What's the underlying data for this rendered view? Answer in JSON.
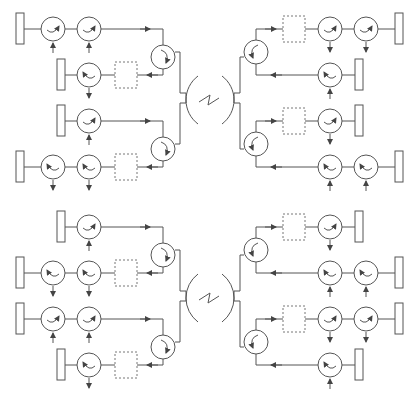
{
  "diagram": {
    "title": "",
    "colors": {
      "line": "#555555",
      "background": "#ffffff",
      "text": "#333333"
    },
    "channel": {
      "symbol": "~",
      "icon": "channel-lightning-icon"
    },
    "modulator_labels": [
      "+",
      "−",
      "+"
    ],
    "halves": [
      {
        "id": "upper",
        "left": {
          "rows": [
            {
              "labels": [
                "1",
                "5"
              ],
              "direction": "in"
            },
            {
              "labels": [
                "4′"
              ],
              "direction": "out"
            },
            {
              "labels": [
                "4"
              ],
              "direction": "in"
            },
            {
              "labels": [
                "1′",
                "5′"
              ],
              "direction": "out"
            }
          ]
        },
        "right": {
          "rows": [
            {
              "labels": [
                "1",
                "5"
              ],
              "direction": "out"
            },
            {
              "labels": [
                "4′"
              ],
              "direction": "in"
            },
            {
              "labels": [
                "4"
              ],
              "direction": "out"
            },
            {
              "labels": [
                "1′",
                "5′"
              ],
              "direction": "in"
            }
          ]
        }
      },
      {
        "id": "lower",
        "left": {
          "rows": [
            {
              "labels": [
                "3"
              ],
              "direction": "in"
            },
            {
              "labels": [
                "2′",
                "6′"
              ],
              "direction": "out"
            },
            {
              "labels": [
                "2",
                "6"
              ],
              "direction": "in"
            },
            {
              "labels": [
                "3′"
              ],
              "direction": "out"
            }
          ]
        },
        "right": {
          "rows": [
            {
              "labels": [
                "3"
              ],
              "direction": "out"
            },
            {
              "labels": [
                "2′",
                "6′"
              ],
              "direction": "in"
            },
            {
              "labels": [
                "2",
                "6"
              ],
              "direction": "out"
            },
            {
              "labels": [
                "3′"
              ],
              "direction": "in"
            }
          ]
        }
      }
    ]
  }
}
